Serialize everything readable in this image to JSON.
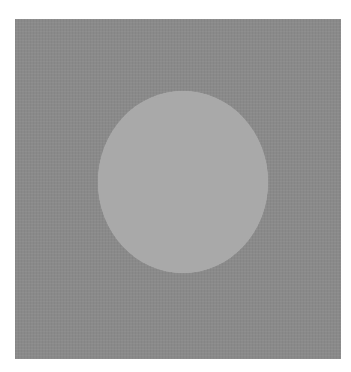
{
  "image": {
    "description": "Light gray circle centered on a textured dark gray square",
    "colors": {
      "background": "#ffffff",
      "square": "#8a8a8a",
      "circle": "#a9a9a9"
    }
  }
}
